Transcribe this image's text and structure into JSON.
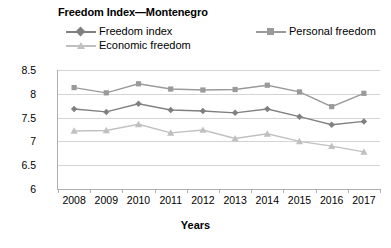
{
  "chart_data": {
    "type": "line",
    "title": "Freedom Index—Montenegro",
    "xlabel": "Years",
    "ylabel": "Index scores",
    "categories": [
      "2008",
      "2009",
      "2010",
      "2011",
      "2012",
      "2013",
      "2014",
      "2015",
      "2016",
      "2017"
    ],
    "ylim": [
      6,
      8.5
    ],
    "yticks": [
      "6",
      "6.5",
      "7",
      "7.5",
      "8",
      "8.5"
    ],
    "ytick_values": [
      6,
      6.5,
      7,
      7.5,
      8,
      8.5
    ],
    "grid": true,
    "legend_position": "top",
    "series": [
      {
        "name": "Freedom index",
        "marker": "diamond",
        "color": "#808080",
        "values": [
          7.68,
          7.62,
          7.79,
          7.66,
          7.64,
          7.6,
          7.68,
          7.52,
          7.35,
          7.42
        ]
      },
      {
        "name": "Personal freedom",
        "marker": "square",
        "color": "#9a9a9a",
        "values": [
          8.13,
          8.02,
          8.21,
          8.1,
          8.08,
          8.09,
          8.18,
          8.04,
          7.73,
          8.01
        ]
      },
      {
        "name": "Economic freedom",
        "marker": "triangle",
        "color": "#c0c0c0",
        "values": [
          7.22,
          7.23,
          7.36,
          7.18,
          7.24,
          7.06,
          7.16,
          7.0,
          6.9,
          6.78
        ]
      }
    ]
  },
  "colors": {
    "series_1": "#808080",
    "series_2": "#9a9a9a",
    "series_3": "#c0c0c0",
    "axis": "#aeaeae",
    "grid": "#d4d4d4",
    "text": "#000000",
    "background": "#ffffff"
  }
}
